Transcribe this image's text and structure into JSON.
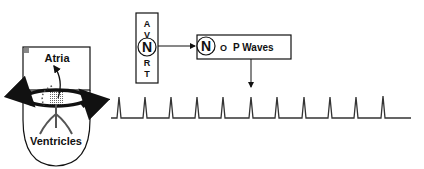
{
  "heart": {
    "atria_label": "Atria",
    "ventricles_label": "Ventricles"
  },
  "avnrt_box": {
    "letters": [
      "A",
      "V",
      "N",
      "R",
      "T"
    ],
    "circled_letter": "N"
  },
  "no_p_box": {
    "circled_letter": "N",
    "small_letter": "O",
    "text": "P Waves"
  },
  "ecg": {
    "beats": 11,
    "marked_beat_index": 5
  }
}
